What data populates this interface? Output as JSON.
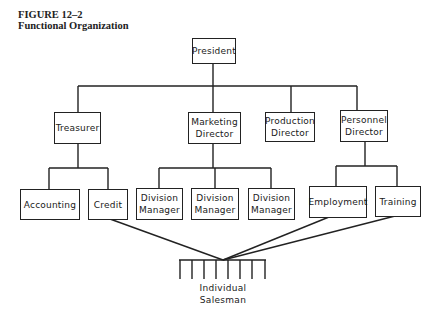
{
  "figure": {
    "number": "FIGURE 12–2",
    "title": "Functional Organization"
  },
  "chart": {
    "type": "org-chart",
    "top": {
      "id": "president",
      "lines": [
        "President"
      ]
    },
    "level2": [
      {
        "id": "treasurer",
        "lines": [
          "Treasurer"
        ]
      },
      {
        "id": "marketing-director",
        "lines": [
          "Marketing",
          "Director"
        ]
      },
      {
        "id": "production-director",
        "lines": [
          "Production",
          "Director"
        ]
      },
      {
        "id": "personnel-director",
        "lines": [
          "Personnel",
          "Director"
        ]
      }
    ],
    "level3": [
      {
        "id": "accounting",
        "parent": "treasurer",
        "lines": [
          "Accounting"
        ]
      },
      {
        "id": "credit",
        "parent": "treasurer",
        "lines": [
          "Credit"
        ]
      },
      {
        "id": "division-manager-1",
        "parent": "marketing-director",
        "lines": [
          "Division",
          "Manager"
        ]
      },
      {
        "id": "division-manager-2",
        "parent": "marketing-director",
        "lines": [
          "Division",
          "Manager"
        ]
      },
      {
        "id": "division-manager-3",
        "parent": "marketing-director",
        "lines": [
          "Division",
          "Manager"
        ]
      },
      {
        "id": "employment",
        "parent": "personnel-director",
        "lines": [
          "Employment"
        ]
      },
      {
        "id": "training",
        "parent": "personnel-director",
        "lines": [
          "Training"
        ]
      }
    ],
    "bottom": {
      "id": "individual-salesman",
      "lines": [
        "Individual",
        "Salesman"
      ],
      "fed_by": [
        "credit",
        "division-manager-3",
        "employment",
        "training"
      ]
    }
  }
}
